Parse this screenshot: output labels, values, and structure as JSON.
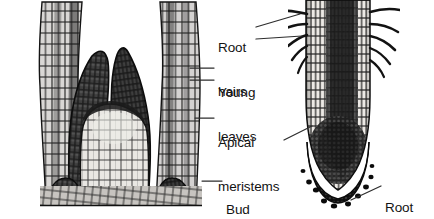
{
  "figure": {
    "title": "Shoot apex and root tip longitudinal sections",
    "background_color": "#ffffff",
    "ink_color": "#1a1a1a",
    "width": 434,
    "height": 219
  },
  "labels": [
    {
      "id": "root-hairs",
      "line1": "Root",
      "line2": "hairs",
      "x": 218,
      "y": 12,
      "target": "root-hair-projections"
    },
    {
      "id": "young-leaves",
      "line1": "Young",
      "line2": "leaves",
      "x": 218,
      "y": 57,
      "target": "young-leaf-primordia"
    },
    {
      "id": "apical-meristems",
      "line1": "Apical",
      "line2": "meristems",
      "x": 218,
      "y": 107,
      "target": "apical-meristem-domes"
    },
    {
      "id": "bud",
      "line1": "Bud",
      "line2": "",
      "x": 226,
      "y": 169,
      "target": "axillary-bud"
    },
    {
      "id": "root-cap",
      "line1": "Root",
      "line2": "cap",
      "x": 385,
      "y": 172,
      "target": "root-cap-cells"
    }
  ],
  "leaders": [
    {
      "id": "leader-root-hairs-upper",
      "x1": 256,
      "y1": 27,
      "x2": 300,
      "y2": 15
    },
    {
      "id": "leader-root-hairs-lower",
      "x1": 256,
      "y1": 39,
      "x2": 302,
      "y2": 36
    },
    {
      "id": "leader-young-leaves-upper",
      "x1": 214,
      "y1": 68,
      "x2": 191,
      "y2": 68
    },
    {
      "id": "leader-young-leaves-lower",
      "x1": 214,
      "y1": 80,
      "x2": 191,
      "y2": 80
    },
    {
      "id": "leader-apical-meristem-shoot",
      "x1": 214,
      "y1": 118,
      "x2": 196,
      "y2": 118
    },
    {
      "id": "leader-apical-meristem-root",
      "x1": 283,
      "y1": 140,
      "x2": 311,
      "y2": 126
    },
    {
      "id": "leader-bud",
      "x1": 222,
      "y1": 181,
      "x2": 203,
      "y2": 181
    },
    {
      "id": "leader-root-cap",
      "x1": 381,
      "y1": 186,
      "x2": 352,
      "y2": 200
    }
  ],
  "structures": [
    {
      "id": "shoot-apex",
      "name": "shoot apex longitudinal section",
      "side": "left"
    },
    {
      "id": "root-tip",
      "name": "root tip longitudinal section",
      "side": "right"
    }
  ]
}
